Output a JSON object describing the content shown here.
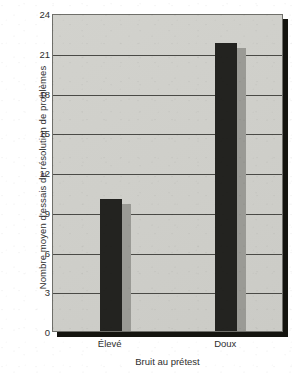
{
  "chart_data": {
    "type": "bar",
    "title": "",
    "subtitle": "",
    "xlabel": "Bruit au prétest",
    "ylabel": "Nombre moyen d'essais de résolution de problèmes",
    "categories": [
      "Élevé",
      "Doux"
    ],
    "values": [
      10,
      21.7
    ],
    "ylim": [
      0,
      24
    ],
    "yticks": [
      0,
      3,
      6,
      9,
      12,
      15,
      18,
      21,
      24
    ],
    "ytick_labels": [
      "0",
      "3",
      "6",
      "9",
      "12",
      "15",
      "18",
      "21",
      "24"
    ],
    "grid": "horizontal",
    "legend": "none",
    "annotations": [],
    "series": [
      {
        "name": "Nombre moyen d'essais de résolution de problèmes",
        "values": [
          10,
          21.7
        ]
      }
    ],
    "style": {
      "bar_color": "#232320",
      "bar_shadow_color": "#9a9a95",
      "plot_background": "#d0d0cb",
      "gridline_color": "#4a4a46",
      "frame_shadow_color": "#14140f",
      "text_color": "#2e2e2e"
    }
  }
}
